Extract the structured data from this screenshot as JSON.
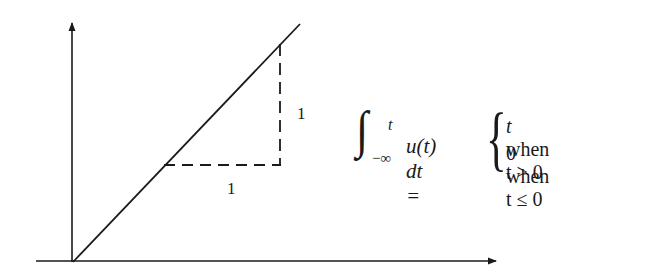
{
  "diagram": {
    "type": "ramp-function-plot",
    "axes": {
      "origin_px": [
        73,
        262
      ],
      "x_axis": {
        "from_px": 36,
        "to_px": 497,
        "y_px": 261,
        "arrow": true
      },
      "y_axis": {
        "x_px": 72,
        "from_px": 262,
        "to_px": 22,
        "arrow": true
      }
    },
    "ramp_line": {
      "start_px": [
        73,
        262
      ],
      "end_px": [
        300,
        24
      ],
      "style": "solid"
    },
    "slope_triangle": {
      "horizontal_leg": {
        "from_px": [
          163,
          165
        ],
        "to_px": [
          280,
          165
        ],
        "style": "dashed",
        "label": "1"
      },
      "vertical_leg": {
        "from_px": [
          280,
          44
        ],
        "to_px": [
          280,
          165
        ],
        "style": "dashed",
        "label": "1"
      }
    },
    "labels": {
      "horizontal_run": "1",
      "vertical_rise": "1"
    }
  },
  "equation": {
    "integral_sign": "∫",
    "upper_limit": "t",
    "lower_limit": "−∞",
    "integrand": "u(t) dt =",
    "brace": "{",
    "cases": [
      {
        "value": "t",
        "condition": " when t > 0"
      },
      {
        "value": "0",
        "condition": " when t ≤ 0"
      }
    ]
  },
  "colors": {
    "ink": "#1a1a1a",
    "background": "#ffffff"
  }
}
